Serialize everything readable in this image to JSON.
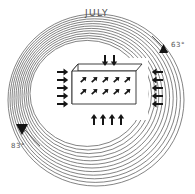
{
  "diagram": {
    "title": "JULY",
    "type": "climate-pressure-wind-diagram",
    "background_color": "#ffffff",
    "line_color": "#5a5a5a",
    "arrow_color": "#161616"
  },
  "markers": [
    {
      "id": "temp-top-right",
      "label": "63°",
      "value": 63,
      "unit": "degrees",
      "position": "top-right",
      "icon": "triangle-marker"
    },
    {
      "id": "temp-bottom-left",
      "label": "83°",
      "value": 83,
      "unit": "degrees",
      "position": "bottom-left",
      "icon": "triangle-marker"
    }
  ],
  "isobars": {
    "name": "concentric-pressure-rings",
    "ring_count": 12,
    "center_x": 96,
    "center_y": 100,
    "outer_radius": 88,
    "inner_radius": 58,
    "description": "nested closed contour rings, tightly spaced on the left, wider at the bottom"
  },
  "region_box": {
    "name": "landmass-block",
    "shape": "3d-rectangular-prism",
    "interior_arrow_rows": 2,
    "interior_arrows_per_row": 5,
    "interior_arrow_direction": "northeast"
  },
  "wind_arrows": {
    "left": {
      "count": 5,
      "direction": "right",
      "label": "inflow-west"
    },
    "right": {
      "count": 5,
      "direction": "left",
      "label": "inflow-east"
    },
    "bottom": {
      "count": 4,
      "direction": "up",
      "label": "inflow-south"
    },
    "top": {
      "count": 2,
      "direction": "down",
      "label": "inflow-north"
    }
  }
}
